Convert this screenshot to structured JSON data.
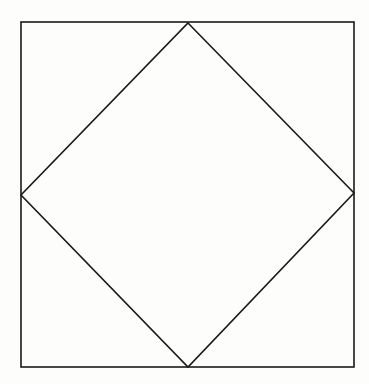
{
  "diagram": {
    "background": "#fdfdfb",
    "stroke_color": "#1a1a1a",
    "stroke_width": 1.6,
    "outer_square": {
      "x1": 21,
      "y1": 22,
      "x2": 354,
      "y2": 367
    },
    "inner_diamond": {
      "top": [
        188,
        23
      ],
      "right": [
        354,
        193
      ],
      "bottom": [
        188,
        367
      ],
      "left": [
        21,
        195
      ]
    }
  }
}
